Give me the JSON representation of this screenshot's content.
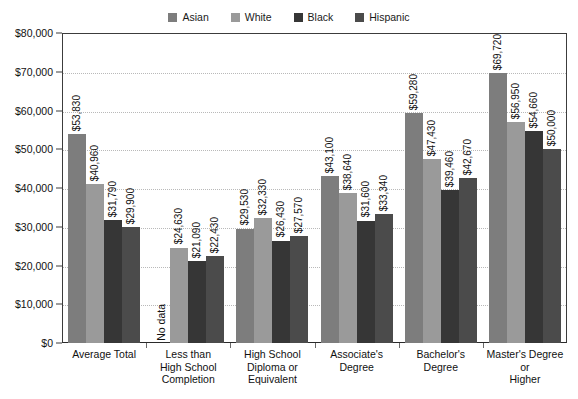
{
  "chart_data": {
    "type": "bar",
    "title": "",
    "xlabel": "",
    "ylabel": "",
    "ylim": [
      0,
      80000
    ],
    "grid": true,
    "legend_position": "top-center",
    "categories": [
      "Average Total",
      "Less than High School Completion",
      "High School Diploma or Equivalent",
      "Associate's Degree",
      "Bachelor's Degree",
      "Master's Degree or Higher"
    ],
    "category_lines": [
      [
        "Average Total"
      ],
      [
        "Less than",
        "High School",
        "Completion"
      ],
      [
        "High School",
        "Diploma or",
        "Equivalent"
      ],
      [
        "Associate's",
        "Degree"
      ],
      [
        "Bachelor's",
        "Degree"
      ],
      [
        "Master's Degree",
        "or",
        "Higher"
      ]
    ],
    "y_ticks": [
      0,
      10000,
      20000,
      30000,
      40000,
      50000,
      60000,
      70000,
      80000
    ],
    "y_tick_labels": [
      "$0",
      "$10,000",
      "$20,000",
      "$30,000",
      "$40,000",
      "$50,000",
      "$60,000",
      "$70,000",
      "$80,000"
    ],
    "series": [
      {
        "name": "Asian",
        "color": "#7d7d7d",
        "values": [
          53830,
          null,
          29530,
          43100,
          59280,
          69720
        ],
        "labels": [
          "$53,830",
          "No data",
          "$29,530",
          "$43,100",
          "$59,280",
          "$69,720"
        ]
      },
      {
        "name": "White",
        "color": "#9a9a9a",
        "values": [
          40960,
          24630,
          32330,
          38640,
          47430,
          56950
        ],
        "labels": [
          "$40,960",
          "$24,630",
          "$32,330",
          "$38,640",
          "$47,430",
          "$56,950"
        ]
      },
      {
        "name": "Black",
        "color": "#363636",
        "values": [
          31790,
          21090,
          26430,
          31600,
          39460,
          54660
        ],
        "labels": [
          "$31,790",
          "$21,090",
          "$26,430",
          "$31,600",
          "$39,460",
          "$54,660"
        ]
      },
      {
        "name": "Hispanic",
        "color": "#4b4b4b",
        "values": [
          29900,
          22430,
          27570,
          33340,
          42670,
          50000
        ],
        "labels": [
          "$29,900",
          "$22,430",
          "$27,570",
          "$33,340",
          "$42,670",
          "$50,000"
        ]
      }
    ],
    "no_data_text": "No data"
  },
  "legend": {
    "items": [
      {
        "label": "Asian",
        "color": "#7d7d7d"
      },
      {
        "label": "White",
        "color": "#9a9a9a"
      },
      {
        "label": "Black",
        "color": "#363636"
      },
      {
        "label": "Hispanic",
        "color": "#4b4b4b"
      }
    ]
  },
  "colors": {
    "axis": "#3c3c3c",
    "gridline": "#b9b9b9",
    "text": "#111111",
    "background": "#ffffff"
  }
}
